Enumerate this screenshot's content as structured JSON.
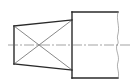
{
  "drawing": {
    "type": "technical-engineering-drawing",
    "description": "Shaft end with tapered flat section (crossed diagonals) joined to a cylindrical body with break line",
    "colors": {
      "outline": "#2a2a2a",
      "thin_lines": "#555555",
      "centerline": "#666666",
      "background": "#ffffff"
    },
    "taper": {
      "left_x": 14,
      "left_top_y": 26,
      "left_bottom_y": 64,
      "right_x": 72,
      "right_top_y": 20,
      "right_bottom_y": 70,
      "cross_diagonals": true
    },
    "body": {
      "left_x": 72,
      "right_x": 118,
      "top_y": 12,
      "bottom_y": 78,
      "right_edge": "break-line"
    },
    "centerline": {
      "y": 45,
      "x_start": 8,
      "x_end": 131,
      "style": "dash-dot"
    }
  }
}
